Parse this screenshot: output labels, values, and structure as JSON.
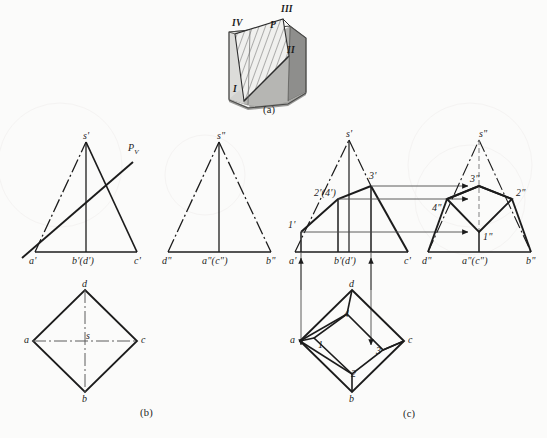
{
  "figure": {
    "background_color": "#fbfbfa",
    "line_color": "#1c1c1c",
    "captions": [
      {
        "id": "a",
        "text": "(a)",
        "x": 269,
        "y": 110
      },
      {
        "id": "b",
        "text": "(b)",
        "x": 146,
        "y": 412
      },
      {
        "id": "c",
        "text": "(c)",
        "x": 409,
        "y": 413
      }
    ]
  },
  "pictorial": {
    "name": "pyramid-pictorial-view",
    "labels": [
      {
        "text": "I",
        "x": 238,
        "y": 88
      },
      {
        "text": "II",
        "x": 287,
        "y": 49
      },
      {
        "text": "III",
        "x": 284,
        "y": 10
      },
      {
        "text": "IV",
        "x": 238,
        "y": 22
      },
      {
        "text": "P",
        "x": 275,
        "y": 25
      }
    ],
    "colors": {
      "left_face": "#d9d9d6",
      "front_face": "#b3b3b0",
      "right_face": "#8c8c8a",
      "top_face": "#c9c9c6",
      "section_fill": "#ededea",
      "hatch": "#4a4a4a"
    }
  },
  "view_b": {
    "name": "given-views",
    "front_view": {
      "vertices": {
        "s_prime": "s'",
        "a_prime": "a'",
        "b_d_prime": "b'(d')",
        "c_prime": "c'"
      },
      "plane_trace": "P",
      "plane_trace_sub": "V"
    },
    "side_view": {
      "vertices": {
        "s_double": "s\"",
        "d_double": "d\"",
        "a_c_double": "a\"(c\")",
        "b_double": "b\""
      }
    },
    "top_view": {
      "vertices": {
        "a": "a",
        "b": "b",
        "c": "c",
        "d": "d",
        "s": "s"
      }
    }
  },
  "view_c": {
    "name": "solution-views",
    "front_view": {
      "vertices": {
        "s_prime": "s'",
        "a_prime": "a'",
        "b_d_prime": "b'(d')",
        "c_prime": "c'"
      },
      "section_points": {
        "p1": "1'",
        "p2_4": "2'(4')",
        "p3": "3'"
      }
    },
    "side_view": {
      "vertices": {
        "s_double": "s\"",
        "d_double": "d\"",
        "a_c_double": "a\"(c\")",
        "b_double": "b\""
      },
      "section_points": {
        "p1": "1\"",
        "p2": "2\"",
        "p3": "3\"",
        "p4": "4\""
      }
    },
    "top_view": {
      "vertices": {
        "a": "a",
        "b": "b",
        "c": "c",
        "d": "d"
      },
      "section_points": {
        "p1": "1",
        "p2": "2",
        "p3": "3",
        "p4": "4"
      }
    }
  }
}
